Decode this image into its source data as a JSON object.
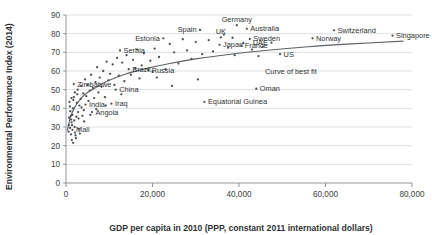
{
  "chart_data": {
    "type": "scatter",
    "title": "",
    "xlabel": "GDP per capita in 2010 (PPP, constant 2011 international dollars)",
    "ylabel": "Environmental Performance Index (2014)",
    "xlim": [
      0,
      80000
    ],
    "ylim": [
      0,
      90
    ],
    "xticks": [
      "0",
      "20,000",
      "40,000",
      "60,000",
      "80,000"
    ],
    "xtick_values": [
      0,
      20000,
      40000,
      60000,
      80000
    ],
    "yticks": [
      "0",
      "10",
      "20",
      "30",
      "40",
      "50",
      "60",
      "70",
      "80",
      "90"
    ],
    "ytick_values": [
      0,
      10,
      20,
      30,
      40,
      50,
      60,
      70,
      80,
      90
    ],
    "grid": true,
    "legend": "none",
    "annotations": [
      {
        "text": "Curve of best fit",
        "x": 52000,
        "y": 58.5
      }
    ],
    "series": [
      {
        "name": "Countries",
        "marker": "dot",
        "color": "#4e5155",
        "points": [
          {
            "x": 62000,
            "y": 81.8,
            "label": "Switzerland",
            "label_pos": "right"
          },
          {
            "x": 39500,
            "y": 84.5,
            "label": "Germany",
            "label_pos": "above"
          },
          {
            "x": 41800,
            "y": 82.6,
            "label": "Australia",
            "label_pos": "right"
          },
          {
            "x": 31000,
            "y": 82.0,
            "label": "Spain",
            "label_pos": "left"
          },
          {
            "x": 75500,
            "y": 79.0,
            "label": "Singapore",
            "label_pos": "right"
          },
          {
            "x": 57000,
            "y": 77.5,
            "label": "Norway",
            "label_pos": "right"
          },
          {
            "x": 35800,
            "y": 78.0,
            "label": "UK",
            "label_pos": "above"
          },
          {
            "x": 42500,
            "y": 77.2,
            "label": "Sweden",
            "label_pos": "right"
          },
          {
            "x": 35500,
            "y": 74.0,
            "label": "Japan",
            "label_pos": "right"
          },
          {
            "x": 40500,
            "y": 73.5,
            "label": "France",
            "label_pos": "right"
          },
          {
            "x": 47500,
            "y": 75.2,
            "label": "UAE",
            "label_pos": "left"
          },
          {
            "x": 49500,
            "y": 69.0,
            "label": "US",
            "label_pos": "right"
          },
          {
            "x": 22500,
            "y": 77.5,
            "label": "Estonia",
            "label_pos": "left"
          },
          {
            "x": 1800,
            "y": 53.0,
            "label": "Zimbabwe",
            "label_pos": "right"
          },
          {
            "x": 12500,
            "y": 71.0,
            "label": "Serbia",
            "label_pos": "right"
          },
          {
            "x": 14500,
            "y": 61.0,
            "label": "Brazil",
            "label_pos": "right"
          },
          {
            "x": 19000,
            "y": 60.5,
            "label": "Russia",
            "label_pos": "right"
          },
          {
            "x": 11500,
            "y": 50.0,
            "label": "China",
            "label_pos": "right"
          },
          {
            "x": 4500,
            "y": 42.0,
            "label": "India",
            "label_pos": "right"
          },
          {
            "x": 10500,
            "y": 42.5,
            "label": "Iraq",
            "label_pos": "right"
          },
          {
            "x": 6000,
            "y": 38.0,
            "label": "Angola",
            "label_pos": "right"
          },
          {
            "x": 1500,
            "y": 28.5,
            "label": "Mali",
            "label_pos": "right"
          },
          {
            "x": 44000,
            "y": 50.5,
            "label": "Oman",
            "label_pos": "right"
          },
          {
            "x": 32000,
            "y": 43.5,
            "label": "Equatorial Guinea",
            "label_pos": "right"
          },
          {
            "x": 800,
            "y": 43.5,
            "label": "",
            "label_pos": ""
          },
          {
            "x": 900,
            "y": 41.0,
            "label": "",
            "label_pos": ""
          },
          {
            "x": 1000,
            "y": 38.5,
            "label": "",
            "label_pos": ""
          },
          {
            "x": 1100,
            "y": 36.0,
            "label": "",
            "label_pos": ""
          },
          {
            "x": 1200,
            "y": 34.0,
            "label": "",
            "label_pos": ""
          },
          {
            "x": 1300,
            "y": 32.5,
            "label": "",
            "label_pos": ""
          },
          {
            "x": 1400,
            "y": 31.0,
            "label": "",
            "label_pos": ""
          },
          {
            "x": 1500,
            "y": 36.5,
            "label": "",
            "label_pos": ""
          },
          {
            "x": 1600,
            "y": 40.0,
            "label": "",
            "label_pos": ""
          },
          {
            "x": 1700,
            "y": 44.5,
            "label": "",
            "label_pos": ""
          },
          {
            "x": 1800,
            "y": 46.0,
            "label": "",
            "label_pos": ""
          },
          {
            "x": 1900,
            "y": 33.5,
            "label": "",
            "label_pos": ""
          },
          {
            "x": 2000,
            "y": 30.0,
            "label": "",
            "label_pos": ""
          },
          {
            "x": 2100,
            "y": 27.0,
            "label": "",
            "label_pos": ""
          },
          {
            "x": 2200,
            "y": 25.5,
            "label": "",
            "label_pos": ""
          },
          {
            "x": 2300,
            "y": 24.0,
            "label": "",
            "label_pos": ""
          },
          {
            "x": 2400,
            "y": 35.5,
            "label": "",
            "label_pos": ""
          },
          {
            "x": 2500,
            "y": 43.0,
            "label": "",
            "label_pos": ""
          },
          {
            "x": 2600,
            "y": 47.5,
            "label": "",
            "label_pos": ""
          },
          {
            "x": 2700,
            "y": 50.0,
            "label": "",
            "label_pos": ""
          },
          {
            "x": 2800,
            "y": 38.0,
            "label": "",
            "label_pos": ""
          },
          {
            "x": 2900,
            "y": 34.5,
            "label": "",
            "label_pos": ""
          },
          {
            "x": 3000,
            "y": 29.0,
            "label": "",
            "label_pos": ""
          },
          {
            "x": 3200,
            "y": 26.5,
            "label": "",
            "label_pos": ""
          },
          {
            "x": 3400,
            "y": 45.0,
            "label": "",
            "label_pos": ""
          },
          {
            "x": 3500,
            "y": 52.0,
            "label": "",
            "label_pos": ""
          },
          {
            "x": 3600,
            "y": 40.5,
            "label": "",
            "label_pos": ""
          },
          {
            "x": 3800,
            "y": 36.0,
            "label": "",
            "label_pos": ""
          },
          {
            "x": 4000,
            "y": 48.0,
            "label": "",
            "label_pos": ""
          },
          {
            "x": 4200,
            "y": 33.0,
            "label": "",
            "label_pos": ""
          },
          {
            "x": 4400,
            "y": 55.5,
            "label": "",
            "label_pos": ""
          },
          {
            "x": 4700,
            "y": 46.5,
            "label": "",
            "label_pos": ""
          },
          {
            "x": 5000,
            "y": 52.5,
            "label": "",
            "label_pos": ""
          },
          {
            "x": 5200,
            "y": 44.0,
            "label": "",
            "label_pos": ""
          },
          {
            "x": 5500,
            "y": 49.5,
            "label": "",
            "label_pos": ""
          },
          {
            "x": 5800,
            "y": 58.0,
            "label": "",
            "label_pos": ""
          },
          {
            "x": 6200,
            "y": 51.0,
            "label": "",
            "label_pos": ""
          },
          {
            "x": 6500,
            "y": 45.5,
            "label": "",
            "label_pos": ""
          },
          {
            "x": 6800,
            "y": 54.0,
            "label": "",
            "label_pos": ""
          },
          {
            "x": 7200,
            "y": 62.0,
            "label": "",
            "label_pos": ""
          },
          {
            "x": 7500,
            "y": 48.5,
            "label": "",
            "label_pos": ""
          },
          {
            "x": 7800,
            "y": 56.5,
            "label": "",
            "label_pos": ""
          },
          {
            "x": 8200,
            "y": 51.5,
            "label": "",
            "label_pos": ""
          },
          {
            "x": 8600,
            "y": 60.0,
            "label": "",
            "label_pos": ""
          },
          {
            "x": 9000,
            "y": 46.0,
            "label": "",
            "label_pos": ""
          },
          {
            "x": 9400,
            "y": 65.0,
            "label": "",
            "label_pos": ""
          },
          {
            "x": 9800,
            "y": 55.0,
            "label": "",
            "label_pos": ""
          },
          {
            "x": 10200,
            "y": 58.5,
            "label": "",
            "label_pos": ""
          },
          {
            "x": 10800,
            "y": 63.5,
            "label": "",
            "label_pos": ""
          },
          {
            "x": 11200,
            "y": 52.5,
            "label": "",
            "label_pos": ""
          },
          {
            "x": 11800,
            "y": 67.0,
            "label": "",
            "label_pos": ""
          },
          {
            "x": 12200,
            "y": 57.5,
            "label": "",
            "label_pos": ""
          },
          {
            "x": 13000,
            "y": 64.5,
            "label": "",
            "label_pos": ""
          },
          {
            "x": 13500,
            "y": 54.5,
            "label": "",
            "label_pos": ""
          },
          {
            "x": 14000,
            "y": 68.5,
            "label": "",
            "label_pos": ""
          },
          {
            "x": 15000,
            "y": 58.0,
            "label": "",
            "label_pos": ""
          },
          {
            "x": 15500,
            "y": 66.0,
            "label": "",
            "label_pos": ""
          },
          {
            "x": 16000,
            "y": 61.5,
            "label": "",
            "label_pos": ""
          },
          {
            "x": 16500,
            "y": 71.5,
            "label": "",
            "label_pos": ""
          },
          {
            "x": 17000,
            "y": 56.0,
            "label": "",
            "label_pos": ""
          },
          {
            "x": 17500,
            "y": 63.0,
            "label": "",
            "label_pos": ""
          },
          {
            "x": 18000,
            "y": 69.5,
            "label": "",
            "label_pos": ""
          },
          {
            "x": 19500,
            "y": 65.5,
            "label": "",
            "label_pos": ""
          },
          {
            "x": 20000,
            "y": 59.5,
            "label": "",
            "label_pos": ""
          },
          {
            "x": 20500,
            "y": 72.0,
            "label": "",
            "label_pos": ""
          },
          {
            "x": 21500,
            "y": 67.5,
            "label": "",
            "label_pos": ""
          },
          {
            "x": 23000,
            "y": 61.0,
            "label": "",
            "label_pos": ""
          },
          {
            "x": 24000,
            "y": 74.5,
            "label": "",
            "label_pos": ""
          },
          {
            "x": 25000,
            "y": 70.0,
            "label": "",
            "label_pos": ""
          },
          {
            "x": 26000,
            "y": 64.0,
            "label": "",
            "label_pos": ""
          },
          {
            "x": 27000,
            "y": 77.0,
            "label": "",
            "label_pos": ""
          },
          {
            "x": 28000,
            "y": 71.0,
            "label": "",
            "label_pos": ""
          },
          {
            "x": 29000,
            "y": 66.5,
            "label": "",
            "label_pos": ""
          },
          {
            "x": 30000,
            "y": 75.5,
            "label": "",
            "label_pos": ""
          },
          {
            "x": 31500,
            "y": 69.0,
            "label": "",
            "label_pos": ""
          },
          {
            "x": 33000,
            "y": 76.5,
            "label": "",
            "label_pos": ""
          },
          {
            "x": 34000,
            "y": 70.5,
            "label": "",
            "label_pos": ""
          },
          {
            "x": 36500,
            "y": 79.5,
            "label": "",
            "label_pos": ""
          },
          {
            "x": 37500,
            "y": 72.5,
            "label": "",
            "label_pos": ""
          },
          {
            "x": 38500,
            "y": 77.8,
            "label": "",
            "label_pos": ""
          },
          {
            "x": 39000,
            "y": 68.5,
            "label": "",
            "label_pos": ""
          },
          {
            "x": 41000,
            "y": 75.0,
            "label": "",
            "label_pos": ""
          },
          {
            "x": 43000,
            "y": 71.5,
            "label": "",
            "label_pos": ""
          },
          {
            "x": 44500,
            "y": 68.0,
            "label": "",
            "label_pos": ""
          },
          {
            "x": 45500,
            "y": 73.0,
            "label": "",
            "label_pos": ""
          },
          {
            "x": 30500,
            "y": 55.5,
            "label": "",
            "label_pos": ""
          },
          {
            "x": 24500,
            "y": 52.0,
            "label": "",
            "label_pos": ""
          },
          {
            "x": 21000,
            "y": 56.5,
            "label": "",
            "label_pos": ""
          },
          {
            "x": 12800,
            "y": 47.5,
            "label": "",
            "label_pos": ""
          },
          {
            "x": 9200,
            "y": 41.5,
            "label": "",
            "label_pos": ""
          },
          {
            "x": 7000,
            "y": 39.5,
            "label": "",
            "label_pos": ""
          },
          {
            "x": 5600,
            "y": 36.5,
            "label": "",
            "label_pos": ""
          },
          {
            "x": 4100,
            "y": 39.0,
            "label": "",
            "label_pos": ""
          },
          {
            "x": 3100,
            "y": 41.5,
            "label": "",
            "label_pos": ""
          },
          {
            "x": 2050,
            "y": 48.5,
            "label": "",
            "label_pos": ""
          },
          {
            "x": 1250,
            "y": 45.5,
            "label": "",
            "label_pos": ""
          },
          {
            "x": 950,
            "y": 29.5,
            "label": "",
            "label_pos": ""
          },
          {
            "x": 1150,
            "y": 26.0,
            "label": "",
            "label_pos": ""
          },
          {
            "x": 1350,
            "y": 23.0,
            "label": "",
            "label_pos": ""
          },
          {
            "x": 1650,
            "y": 21.5,
            "label": "",
            "label_pos": ""
          },
          {
            "x": 700,
            "y": 35.0,
            "label": "",
            "label_pos": ""
          },
          {
            "x": 650,
            "y": 31.0,
            "label": "",
            "label_pos": ""
          },
          {
            "x": 600,
            "y": 27.5,
            "label": "",
            "label_pos": ""
          }
        ]
      }
    ],
    "fit_curve": {
      "name": "Curve of best fit",
      "points": [
        {
          "x": 300,
          "y": 28.0
        },
        {
          "x": 1000,
          "y": 35.0
        },
        {
          "x": 2000,
          "y": 40.5
        },
        {
          "x": 3500,
          "y": 45.5
        },
        {
          "x": 5000,
          "y": 48.5
        },
        {
          "x": 7500,
          "y": 52.0
        },
        {
          "x": 10000,
          "y": 55.0
        },
        {
          "x": 14000,
          "y": 58.5
        },
        {
          "x": 18000,
          "y": 61.0
        },
        {
          "x": 24000,
          "y": 64.0
        },
        {
          "x": 30000,
          "y": 66.5
        },
        {
          "x": 38000,
          "y": 69.0
        },
        {
          "x": 46000,
          "y": 71.0
        },
        {
          "x": 56000,
          "y": 73.0
        },
        {
          "x": 66000,
          "y": 74.5
        },
        {
          "x": 78000,
          "y": 76.0
        }
      ]
    }
  }
}
